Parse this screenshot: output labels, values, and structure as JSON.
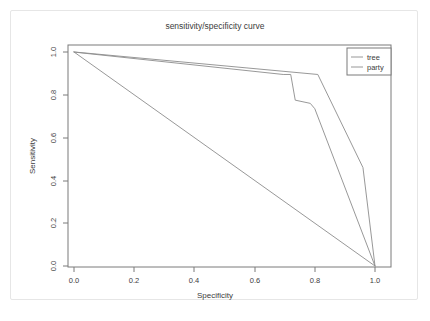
{
  "chart_data": {
    "type": "line",
    "title": "sensitivity/specificity curve",
    "xlabel": "Specificity",
    "ylabel": "Sensitivity",
    "xlim": [
      0.0,
      1.0
    ],
    "ylim": [
      0.0,
      1.0
    ],
    "xticks": [
      "0.0",
      "0.2",
      "0.4",
      "0.6",
      "0.8",
      "1.0"
    ],
    "yticks": [
      "0.0",
      "0.2",
      "0.4",
      "0.6",
      "0.8",
      "1.0"
    ],
    "xtick_values": [
      0.0,
      0.2,
      0.4,
      0.6,
      0.8,
      1.0
    ],
    "ytick_values": [
      0.0,
      0.2,
      0.4,
      0.6,
      0.8,
      1.0
    ],
    "grid": false,
    "legend_position": "top-right",
    "series": [
      {
        "name": "tree",
        "color": "#8c8c8c",
        "x": [
          0.0,
          0.04,
          0.81,
          0.96,
          1.0
        ],
        "y": [
          1.0,
          0.995,
          0.895,
          0.46,
          0.0
        ]
      },
      {
        "name": "party",
        "color": "#8c8c8c",
        "x": [
          0.0,
          0.03,
          0.695,
          0.72,
          0.735,
          0.785,
          0.8,
          1.0
        ],
        "y": [
          1.0,
          0.995,
          0.895,
          0.895,
          0.775,
          0.76,
          0.735,
          0.0
        ]
      },
      {
        "name": "diagonal-reference",
        "color": "#8c8c8c",
        "x": [
          0.0,
          1.0
        ],
        "y": [
          1.0,
          0.0
        ]
      }
    ]
  },
  "legend": {
    "entries": [
      {
        "label": "tree"
      },
      {
        "label": "party"
      }
    ]
  },
  "colors": {
    "frame": "#7a7a7a",
    "text": "#3c3c3c",
    "line": "#8c8c8c",
    "card_border": "#e6e6e6",
    "background": "#ffffff"
  }
}
